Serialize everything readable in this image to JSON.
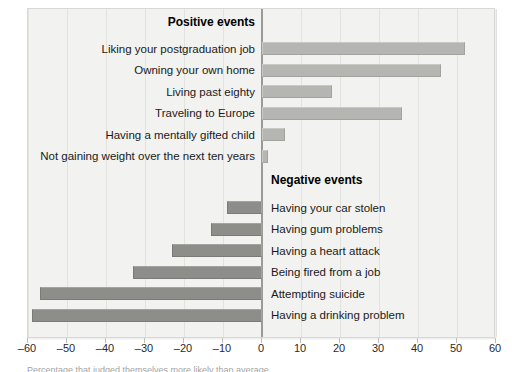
{
  "chart_data": {
    "type": "bar",
    "orientation": "horizontal",
    "title": "",
    "xlabel": "",
    "ylabel": "",
    "xlim": [
      -60,
      60
    ],
    "xticks": [
      -60,
      -50,
      -40,
      -30,
      -20,
      -10,
      0,
      10,
      20,
      30,
      40,
      50,
      60
    ],
    "xtick_labels": [
      "–60",
      "–50",
      "–40",
      "–30",
      "–20",
      "–10",
      "0",
      "10",
      "20",
      "30",
      "40",
      "50",
      "60"
    ],
    "grid": true,
    "legend": "none",
    "groups": [
      {
        "name": "Positive events",
        "heading": "Positive events",
        "label_side": "left",
        "bar_color": "#b5b5b2",
        "categories": [
          "Liking your postgraduation job",
          "Owning your own home",
          "Living past eighty",
          "Traveling to Europe",
          "Having a mentally gifted child",
          "Not gaining weight over the next ten years"
        ],
        "values": [
          52,
          46,
          18,
          36,
          6,
          1.5
        ]
      },
      {
        "name": "Negative events",
        "heading": "Negative events",
        "label_side": "right",
        "bar_color": "#8d8d8a",
        "categories": [
          "Having your car stolen",
          "Having gum problems",
          "Having a heart attack",
          "Being fired from a job",
          "Attempting suicide",
          "Having a drinking problem"
        ],
        "values": [
          -9,
          -13,
          -23,
          -33,
          -57,
          -59
        ]
      }
    ]
  },
  "colors": {
    "panel_background": "#f2f2f0",
    "gridline": "#e2e2de",
    "zero_axis": "#9a9a96",
    "positive_bar": "#b5b5b2",
    "negative_bar": "#8d8d8a",
    "text": "#1a1a1a"
  },
  "footnote": {
    "text": "Percentage that judged themselves more likely than average"
  }
}
